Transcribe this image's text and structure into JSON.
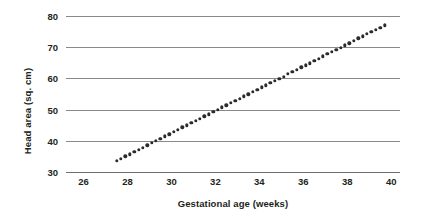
{
  "chart_data": {
    "type": "scatter",
    "title": "",
    "xlabel": "Gestational age (weeks)",
    "ylabel": "Head area (sq. cm)",
    "xlim": [
      25.2,
      40.4
    ],
    "ylim": [
      30,
      80
    ],
    "xticks": [
      26,
      28,
      30,
      32,
      34,
      36,
      38,
      40
    ],
    "yticks": [
      30,
      40,
      50,
      60,
      70,
      80
    ],
    "xtick_labels": [
      "26",
      "28",
      "30",
      "32",
      "34",
      "36",
      "38",
      "40"
    ],
    "ytick_labels": [
      "30",
      "40",
      "50",
      "60",
      "70",
      "80"
    ],
    "grid": "horizontal",
    "legend": "none",
    "marker": "filled-circle",
    "marker_color": "#2b2b2b",
    "gridline_color": "#8a8a8a",
    "background_color": "#ffffff",
    "x": [
      27.5,
      27.7,
      27.9,
      28.1,
      28.3,
      28.5,
      28.7,
      28.9,
      29.1,
      29.3,
      29.5,
      29.7,
      29.9,
      30.1,
      30.3,
      30.5,
      30.7,
      30.9,
      31.1,
      31.3,
      31.5,
      31.7,
      31.9,
      32.1,
      32.3,
      32.5,
      32.7,
      32.9,
      33.1,
      33.3,
      33.5,
      33.7,
      33.9,
      34.1,
      34.3,
      34.5,
      34.7,
      34.9,
      35.1,
      35.3,
      35.5,
      35.7,
      35.9,
      36.1,
      36.3,
      36.5,
      36.7,
      36.9,
      37.1,
      37.3,
      37.5,
      37.7,
      37.9,
      38.1,
      38.3,
      38.5,
      38.7,
      38.9,
      39.1,
      39.3,
      39.5,
      39.7
    ],
    "y": [
      33.6,
      34.3,
      35.0,
      35.7,
      36.4,
      37.1,
      37.8,
      38.6,
      39.3,
      40.0,
      40.7,
      41.4,
      42.1,
      42.8,
      43.5,
      44.3,
      45.0,
      45.7,
      46.4,
      47.1,
      47.8,
      48.5,
      49.2,
      50.0,
      50.7,
      51.4,
      52.1,
      52.8,
      53.5,
      54.2,
      54.9,
      55.7,
      56.4,
      57.1,
      57.8,
      58.5,
      59.2,
      59.9,
      60.6,
      61.4,
      62.1,
      62.8,
      63.5,
      64.2,
      64.9,
      65.6,
      66.3,
      67.1,
      67.8,
      68.5,
      69.2,
      69.9,
      70.6,
      71.3,
      72.0,
      72.8,
      73.5,
      74.2,
      74.9,
      75.6,
      76.3,
      77.0
    ]
  }
}
